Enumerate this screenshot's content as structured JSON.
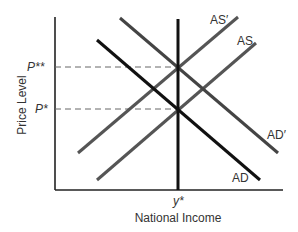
{
  "diagram": {
    "type": "AD-AS economics diagram",
    "x_axis_label": "National Income",
    "y_axis_label": "Price Level",
    "x_tick_label": "y*",
    "y_tick_labels": [
      "P**",
      "P*"
    ],
    "curves": [
      {
        "id": "AS-prime",
        "label": "AS′",
        "kind": "aggregate supply (shifted)",
        "color": "#555555"
      },
      {
        "id": "AS",
        "label": "AS",
        "kind": "aggregate supply",
        "color": "#555555"
      },
      {
        "id": "AD-prime",
        "label": "AD′",
        "kind": "aggregate demand (shifted)",
        "color": "#444444"
      },
      {
        "id": "AD",
        "label": "AD",
        "kind": "aggregate demand",
        "color": "#111111"
      },
      {
        "id": "LRAS",
        "label": "",
        "kind": "vertical long-run supply at y*",
        "color": "#111111"
      }
    ],
    "reference_lines": [
      {
        "label": "P**",
        "style": "dashed"
      },
      {
        "label": "P*",
        "style": "dashed"
      }
    ]
  },
  "labels": {
    "xaxis": "National Income",
    "yaxis": "Price Level",
    "ystar": "y*",
    "pstarstar": "P**",
    "pstar": "P*",
    "as_prime": "AS′",
    "as": "AS",
    "ad_prime": "AD′",
    "ad": "AD"
  }
}
